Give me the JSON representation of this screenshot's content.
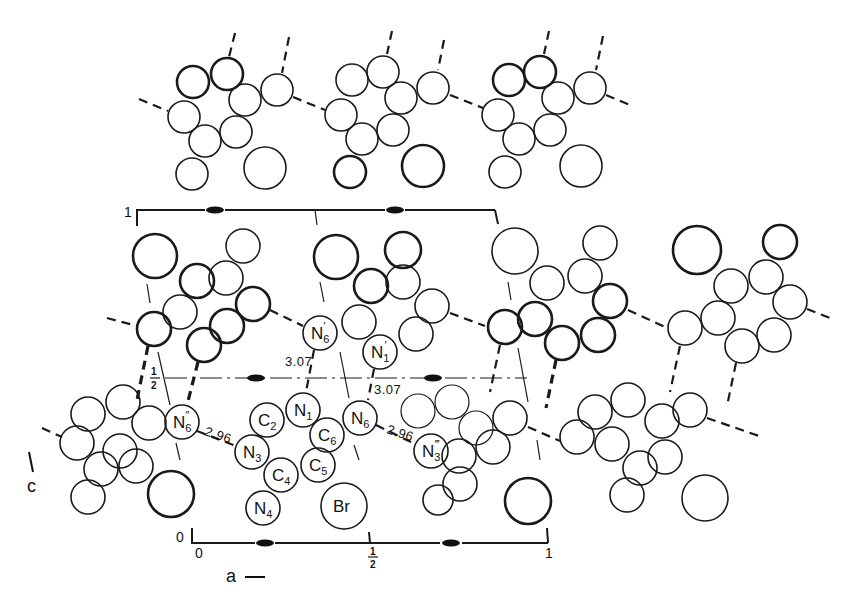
{
  "figure": {
    "axes": {
      "horizontal": {
        "label": "a",
        "arrow": "→",
        "ticks": [
          "0",
          "1/2",
          "1"
        ]
      },
      "vertical": {
        "label": "c",
        "ticks": [
          "0",
          "1/2",
          "1"
        ]
      }
    },
    "atom_labels": {
      "N6_prime": {
        "base": "N",
        "sub": "6",
        "sup": "′"
      },
      "N1_prime": {
        "base": "N",
        "sub": "1",
        "sup": "′"
      },
      "N1": {
        "base": "N",
        "sub": "1"
      },
      "C2": {
        "base": "C",
        "sub": "2"
      },
      "N3": {
        "base": "N",
        "sub": "3"
      },
      "C4": {
        "base": "C",
        "sub": "4"
      },
      "C5": {
        "base": "C",
        "sub": "5"
      },
      "C6": {
        "base": "C",
        "sub": "6"
      },
      "N6": {
        "base": "N",
        "sub": "6"
      },
      "N4": {
        "base": "N",
        "sub": "4"
      },
      "Br": {
        "base": "Br"
      },
      "N6_dprime": {
        "base": "N",
        "sub": "6",
        "sup": "″"
      },
      "N3_tprime": {
        "base": "N",
        "sub": "3",
        "sup": "‴"
      }
    },
    "distances": {
      "N6pp_N3": "2.96",
      "N6_N3ppp": "2.96",
      "N6p_N1": "3.07",
      "N1p_N6": "3.07"
    },
    "cell_labels": {
      "c_one": "1",
      "c_half_num": "1",
      "c_half_den": "2",
      "c_zero": "0",
      "a_zero": "0",
      "a_half_num": "1",
      "a_half_den": "2",
      "a_one": "1"
    },
    "axis_labels": {
      "a": "a",
      "c": "c"
    }
  }
}
